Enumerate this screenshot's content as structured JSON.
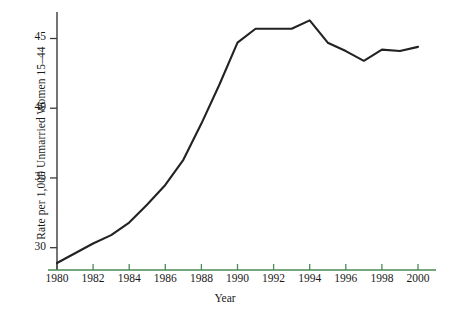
{
  "chart_data": {
    "type": "line",
    "title": "",
    "xlabel": "Year",
    "ylabel": "Rate per 1,000 Unmarried Women 15–44",
    "xlim": [
      1980,
      2000
    ],
    "ylim": [
      28.4,
      46.9
    ],
    "grid": false,
    "legend": null,
    "line_color": "#222222",
    "axis_color": "#4a8a55",
    "x": [
      1980,
      1981,
      1982,
      1983,
      1984,
      1985,
      1986,
      1987,
      1988,
      1989,
      1990,
      1991,
      1992,
      1993,
      1994,
      1995,
      1996,
      1997,
      1998,
      1999,
      2000
    ],
    "values": [
      28.9,
      29.6,
      30.3,
      30.9,
      31.8,
      33.1,
      34.5,
      36.3,
      38.9,
      41.7,
      44.7,
      45.7,
      45.7,
      45.7,
      46.3,
      44.7,
      44.1,
      43.4,
      44.2,
      44.1,
      44.4
    ],
    "x_ticks": [
      1980,
      1982,
      1984,
      1986,
      1988,
      1990,
      1992,
      1994,
      1996,
      1998,
      2000
    ],
    "x_tick_labels": [
      "1980",
      "1982",
      "1984",
      "1986",
      "1988",
      "1990",
      "1992",
      "1994",
      "1996",
      "1998",
      "2000"
    ],
    "y_ticks": [
      30,
      35,
      40,
      45
    ],
    "y_tick_labels": [
      "30",
      "35",
      "40",
      "45"
    ]
  }
}
